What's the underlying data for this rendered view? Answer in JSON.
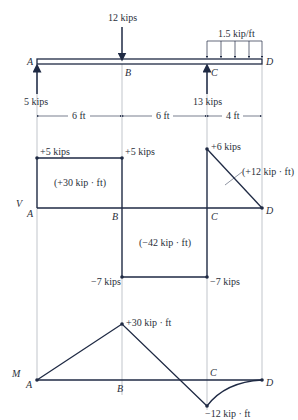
{
  "beam": {
    "points": [
      "A",
      "B",
      "C",
      "D"
    ],
    "point_load": "12 kips",
    "distributed_load": "1.5 kip/ft",
    "reaction_A": "5 kips",
    "reaction_C": "13 kips",
    "spans": [
      "6 ft",
      "6 ft",
      "4 ft"
    ]
  },
  "shear_diagram": {
    "axis_label": "V",
    "points": [
      "A",
      "B",
      "C",
      "D"
    ],
    "values": {
      "A_right": "+5 kips",
      "B_left": "+5 kips",
      "B_right": "−7 kips",
      "C_left": "−7 kips",
      "C_right": "+6 kips"
    },
    "areas": [
      "(+30 kip · ft)",
      "(−42 kip · ft)",
      "(+12 kip · ft)"
    ]
  },
  "moment_diagram": {
    "axis_label": "M",
    "points": [
      "A",
      "B",
      "C",
      "D"
    ],
    "values": {
      "B": "+30 kip · ft",
      "C": "−12 kip · ft"
    }
  },
  "colors": {
    "line": "#1f2a44",
    "guide": "#9aa0a8",
    "text": "#2a2f3a"
  }
}
